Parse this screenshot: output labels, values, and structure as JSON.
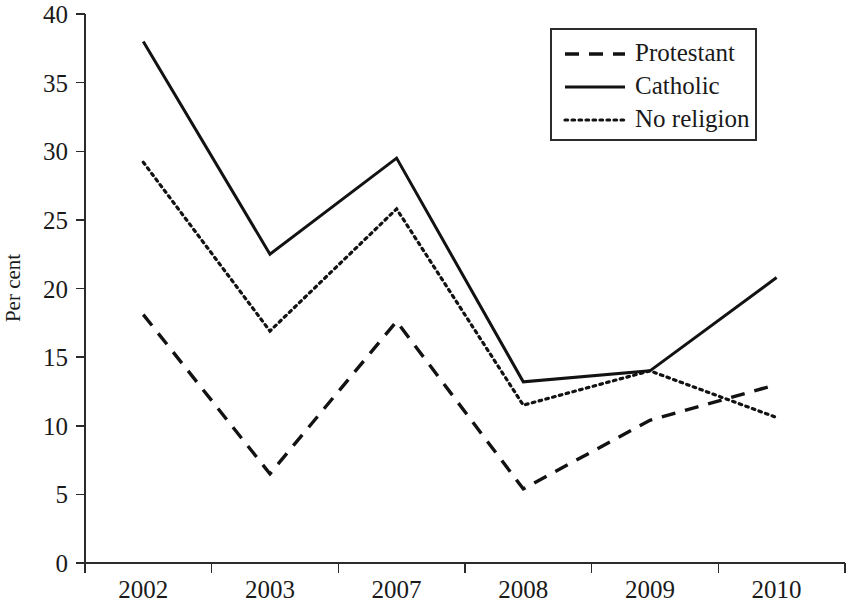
{
  "chart_data": {
    "type": "line",
    "title": "",
    "xlabel": "",
    "ylabel": "Per cent",
    "categories": [
      "2002",
      "2003",
      "2007",
      "2008",
      "2009",
      "2010"
    ],
    "ylim": [
      0,
      40
    ],
    "yticks": [
      0,
      5,
      10,
      15,
      20,
      25,
      30,
      35,
      40
    ],
    "ytick_labels": [
      "0",
      "5",
      "10",
      "15",
      "20",
      "25",
      "30",
      "35",
      "40"
    ],
    "grid": false,
    "legend_position": "top-right",
    "series": [
      {
        "name": "Protestant",
        "style": "dashed",
        "color": "#121212",
        "values": [
          18.1,
          6.5,
          17.6,
          5.4,
          10.4,
          13.0
        ]
      },
      {
        "name": "Catholic",
        "style": "solid",
        "color": "#121212",
        "values": [
          38.0,
          22.5,
          29.5,
          13.2,
          14.0,
          20.8
        ]
      },
      {
        "name": "No religion",
        "style": "dotted",
        "color": "#121212",
        "values": [
          29.2,
          16.9,
          25.8,
          11.5,
          14.0,
          10.6
        ]
      }
    ]
  },
  "legend": {
    "entries": [
      {
        "label": "Protestant"
      },
      {
        "label": "Catholic"
      },
      {
        "label": "No religion"
      }
    ]
  },
  "axes": {
    "y_title": "Per cent"
  }
}
